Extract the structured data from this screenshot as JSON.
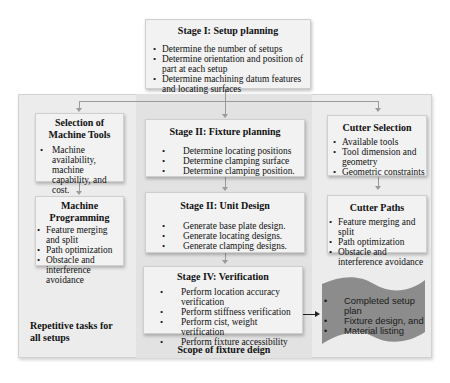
{
  "stage1": {
    "title": "Stage I: Setup planning",
    "items": [
      "Determine the number of setups",
      "Determine orientation and position of part at each setup",
      "Determine machining datum features and locating surfaces"
    ]
  },
  "machine_tools": {
    "title": "Selection of Machine Tools",
    "items": [
      "Machine availability, machine capability, and cost."
    ]
  },
  "machine_programming": {
    "title": "Machine Programming",
    "items": [
      "Feature merging and split",
      "Path optimization",
      "Obstacle and interference avoidance"
    ]
  },
  "stage2_fixture": {
    "title": "Stage II:  Fixture planning",
    "items": [
      "Determine locating positions",
      "Determine clamping surface",
      "Determine clamping position."
    ]
  },
  "stage3_unit": {
    "title": "Stage II: Unit Design",
    "items": [
      "Generate base plate design.",
      "Generate locating designs.",
      "Generate clamping designs."
    ]
  },
  "stage4_verification": {
    "title": "Stage IV: Verification",
    "items": [
      "Perform location accuracy verification",
      "Perform stiffness verification",
      "Perform cist, weight verification",
      "Perform fixture accessibility"
    ]
  },
  "cutter_selection": {
    "title": "Cutter Selection",
    "items": [
      "Available tools",
      "Tool dimension and geometry",
      "Geometric constraints"
    ]
  },
  "cutter_paths": {
    "title": "Cutter Paths",
    "items": [
      "Feature merging and split",
      "Path optimization",
      "Obstacle and interference avoidance"
    ]
  },
  "output_document": {
    "items": [
      "Completed setup plan",
      "Fixture design, and",
      "Material listing"
    ],
    "fill_color": "#8c8c8c"
  },
  "labels": {
    "repetitive": "Repetitive tasks for all setups",
    "scope": "Scope of fixture deign"
  }
}
